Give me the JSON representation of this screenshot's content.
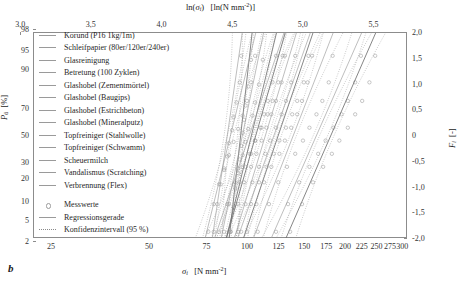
{
  "figure": {
    "subfigure_label": "b",
    "type": "probability-plot"
  },
  "axes": {
    "top": {
      "title_main": "ln(",
      "title_var": "σ",
      "title_sub": "i",
      "title_close": ")",
      "title_unit": "[ln(N mm",
      "title_unit_sup": "-2",
      "title_unit_close": ")]",
      "ticks": [
        "3,0",
        "3,5",
        "4,0",
        "4,5",
        "5,0",
        "5,5"
      ],
      "values": [
        3.0,
        3.5,
        4.0,
        4.5,
        5.0,
        5.5
      ]
    },
    "bottom": {
      "title_var": "σ",
      "title_sub": "i",
      "title_unit": "[N mm",
      "title_unit_sup": "-2",
      "title_unit_close": "]",
      "ticks": [
        "25",
        "50",
        "75",
        "100",
        "125",
        "150",
        "175",
        "200",
        "225",
        "250",
        "275",
        "300"
      ],
      "values": [
        25,
        50,
        75,
        100,
        125,
        150,
        175,
        200,
        225,
        250,
        275,
        300
      ]
    },
    "left": {
      "title_var": "P",
      "title_sub": "ü",
      "title_unit": "[%]",
      "ticks": [
        "98",
        "95",
        "90",
        "70",
        "50",
        "30",
        "20",
        "10",
        "5",
        "2"
      ],
      "values": [
        98,
        95,
        90,
        70,
        50,
        30,
        20,
        10,
        5,
        2
      ]
    },
    "right": {
      "title_var": "F",
      "title_sub": "i",
      "title_unit": "[-]",
      "ticks": [
        "2,0",
        "1,5",
        "1,0",
        "0,5",
        "0",
        "-0,5",
        "-1,0",
        "-1,5",
        "-2,0"
      ],
      "values": [
        2.0,
        1.5,
        1.0,
        0.5,
        0,
        -0.5,
        -1.0,
        -1.5,
        -2.0
      ]
    }
  },
  "legend": {
    "series": [
      {
        "label": "Korund (P16 1kg/1m)"
      },
      {
        "label": "Schleifpapier (80er/120er/240er)"
      },
      {
        "label": "Glasreinigung"
      },
      {
        "label": "Betretung (100 Zyklen)"
      },
      {
        "label": "Glashobel (Zementmörtel)"
      },
      {
        "label": "Glashobel (Baugips)"
      },
      {
        "label": "Glashobel (Estrichbeton)"
      },
      {
        "label": "Glashobel (Mineralputz)"
      },
      {
        "label": "Topfreiniger (Stahlwolle)"
      },
      {
        "label": "Topfreiniger (Schwamm)"
      },
      {
        "label": "Scheuermilch"
      },
      {
        "label": "Vandalismus (Scratching)"
      },
      {
        "label": "Verbrennung (Flex)"
      }
    ],
    "markers": [
      {
        "label": "Messwerte",
        "kind": "circle"
      },
      {
        "label": "Regressionsgerade",
        "kind": "solid"
      },
      {
        "label": "Konfidenzintervall (95 %)",
        "kind": "dotted"
      }
    ]
  },
  "colors": {
    "frame": "#8c8c8c",
    "line": "#9a9a9a",
    "line_dark": "#6f6f6f",
    "marker": "#9b9b9b",
    "ci": "#8a8a8a",
    "text": "#1a1a1a"
  },
  "chart_data": {
    "type": "scatter",
    "title": "",
    "xlabel": "σi [N mm-2]",
    "ylabel": "Pü [%]",
    "xlabel_top": "ln(σi) [ln(N mm-2)]",
    "ylabel_right": "Fi [-]",
    "x_scale": "log",
    "y_scale": "normal-probability",
    "xlim": [
      22,
      310
    ],
    "ylim_probability": [
      2,
      98
    ],
    "ylim_right": [
      -2.0,
      2.0
    ],
    "grid": false,
    "legend_position": "upper-left-inside",
    "series": [
      {
        "name": "Korund (P16 1kg/1m)",
        "fit_x": [
          88,
          104
        ],
        "fit_y": [
          2,
          98
        ],
        "slope_ln": 15.6,
        "x": [
          89,
          91,
          92,
          94,
          95,
          96,
          97,
          98,
          99,
          101,
          103
        ],
        "y": [
          3,
          8,
          15,
          23,
          32,
          42,
          52,
          62,
          72,
          83,
          93
        ]
      },
      {
        "name": "Schleifpapier (80er/120er/240er)",
        "fit_x": [
          78,
          97
        ],
        "fit_y": [
          2,
          98
        ],
        "slope_ln": 13.2,
        "x": [
          79,
          81,
          83,
          85,
          87,
          88,
          90,
          91,
          93,
          95,
          96
        ],
        "y": [
          3,
          9,
          17,
          25,
          34,
          44,
          54,
          64,
          74,
          85,
          94
        ]
      },
      {
        "name": "Glasreinigung",
        "fit_x": [
          83,
          113
        ],
        "fit_y": [
          2,
          98
        ],
        "slope_ln": 9.1,
        "x": [
          85,
          88,
          91,
          94,
          97,
          99,
          101,
          104,
          106,
          109,
          112
        ],
        "y": [
          3,
          9,
          17,
          26,
          35,
          45,
          55,
          65,
          74,
          84,
          93
        ]
      },
      {
        "name": "Betretung (100 Zyklen)",
        "fit_x": [
          86,
          124
        ],
        "fit_y": [
          2,
          98
        ],
        "slope_ln": 7.6,
        "x": [
          88,
          92,
          95,
          99,
          103,
          106,
          110,
          113,
          116,
          120,
          123
        ],
        "y": [
          3,
          9,
          18,
          27,
          36,
          46,
          56,
          66,
          75,
          85,
          94
        ]
      },
      {
        "name": "Glashobel (Zementmörtel)",
        "fit_x": [
          74,
          107
        ],
        "fit_y": [
          2,
          98
        ],
        "slope_ln": 8.4,
        "x": [
          76,
          79,
          82,
          85,
          88,
          91,
          94,
          97,
          100,
          103,
          106
        ],
        "y": [
          3,
          9,
          17,
          26,
          35,
          45,
          55,
          65,
          75,
          85,
          94
        ]
      },
      {
        "name": "Glashobel (Baugips)",
        "fit_x": [
          91,
          143
        ],
        "fit_y": [
          2,
          98
        ],
        "slope_ln": 6.3,
        "x": [
          94,
          99,
          104,
          109,
          114,
          118,
          123,
          128,
          132,
          137,
          141
        ],
        "y": [
          3,
          9,
          18,
          27,
          36,
          46,
          56,
          66,
          75,
          85,
          94
        ]
      },
      {
        "name": "Glashobel (Estrichbeton)",
        "fit_x": [
          97,
          161
        ],
        "fit_y": [
          2,
          98
        ],
        "slope_ln": 5.6,
        "x": [
          100,
          107,
          113,
          119,
          126,
          131,
          137,
          143,
          148,
          154,
          159
        ],
        "y": [
          3,
          9,
          18,
          27,
          36,
          46,
          56,
          66,
          75,
          85,
          94
        ]
      },
      {
        "name": "Glashobel (Mineralputz)",
        "fit_x": [
          104,
          186
        ],
        "fit_y": [
          2,
          98
        ],
        "slope_ln": 4.9,
        "x": [
          108,
          117,
          125,
          133,
          141,
          149,
          156,
          164,
          171,
          179,
          184
        ],
        "y": [
          3,
          9,
          18,
          27,
          36,
          46,
          56,
          66,
          75,
          85,
          94
        ]
      },
      {
        "name": "Topfreiniger (Stahlwolle)",
        "fit_x": [
          79,
          131
        ],
        "fit_y": [
          2,
          98
        ],
        "slope_ln": 6.1,
        "x": [
          82,
          87,
          92,
          97,
          102,
          106,
          111,
          116,
          120,
          125,
          129
        ],
        "y": [
          3,
          9,
          18,
          27,
          36,
          46,
          56,
          66,
          75,
          85,
          94
        ]
      },
      {
        "name": "Topfreiniger (Schwamm)",
        "fit_x": [
          86,
          132
        ],
        "fit_y": [
          2,
          98
        ],
        "slope_ln": 6.9,
        "x": [
          89,
          94,
          98,
          103,
          107,
          111,
          115,
          119,
          123,
          128,
          131
        ],
        "y": [
          3,
          9,
          18,
          27,
          36,
          46,
          56,
          66,
          75,
          85,
          94
        ]
      },
      {
        "name": "Scheuermilch",
        "fit_x": [
          93,
          158
        ],
        "fit_y": [
          2,
          98
        ],
        "slope_ln": 5.5,
        "x": [
          96,
          103,
          109,
          115,
          121,
          126,
          132,
          138,
          143,
          150,
          155
        ],
        "y": [
          3,
          9,
          18,
          27,
          36,
          46,
          56,
          66,
          75,
          85,
          94
        ]
      },
      {
        "name": "Vandalismus (Scratching)",
        "fit_x": [
          118,
          228
        ],
        "fit_y": [
          2,
          98
        ],
        "slope_ln": 4.4,
        "x": [
          123,
          134,
          145,
          156,
          166,
          175,
          185,
          196,
          205,
          216,
          225
        ],
        "y": [
          3,
          9,
          18,
          27,
          36,
          46,
          56,
          66,
          75,
          85,
          94
        ]
      },
      {
        "name": "Verbrennung (Flex)",
        "fit_x": [
          131,
          252
        ],
        "fit_y": [
          2,
          98
        ],
        "slope_ln": 4.4,
        "x": [
          136,
          148,
          160,
          172,
          183,
          193,
          205,
          216,
          227,
          239,
          249
        ],
        "y": [
          3,
          9,
          18,
          27,
          36,
          46,
          56,
          66,
          75,
          85,
          94
        ]
      }
    ]
  }
}
